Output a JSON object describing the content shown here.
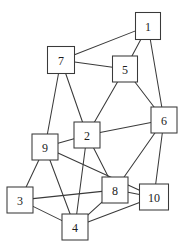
{
  "figure": {
    "background_color": "#ffffff",
    "line_color": "#3a3a3a",
    "label_color": "#1c1c1c"
  },
  "chart_data": {
    "type": "diagram",
    "subtype": "node-link-graph",
    "title": "",
    "xlabel": "",
    "ylabel": "",
    "directed": false,
    "grid": false,
    "legend": null,
    "node_count": 10,
    "edge_count": 22,
    "node_shape": "square",
    "nodes": [
      {
        "id": "1",
        "label": "1",
        "x": 148,
        "y": 26,
        "w": 25,
        "h": 27
      },
      {
        "id": "2",
        "label": "2",
        "x": 87,
        "y": 135,
        "w": 26,
        "h": 26
      },
      {
        "id": "3",
        "label": "3",
        "x": 20,
        "y": 200,
        "w": 26,
        "h": 26
      },
      {
        "id": "4",
        "label": "4",
        "x": 75,
        "y": 227,
        "w": 26,
        "h": 26
      },
      {
        "id": "5",
        "label": "5",
        "x": 125,
        "y": 69,
        "w": 25,
        "h": 26
      },
      {
        "id": "6",
        "label": "6",
        "x": 164,
        "y": 120,
        "w": 26,
        "h": 26
      },
      {
        "id": "7",
        "label": "7",
        "x": 61,
        "y": 60,
        "w": 27,
        "h": 27
      },
      {
        "id": "8",
        "label": "8",
        "x": 115,
        "y": 190,
        "w": 26,
        "h": 26
      },
      {
        "id": "9",
        "label": "9",
        "x": 45,
        "y": 147,
        "w": 26,
        "h": 26
      },
      {
        "id": "10",
        "label": "10",
        "x": 154,
        "y": 197,
        "w": 29,
        "h": 26
      }
    ],
    "edges": [
      {
        "source": "1",
        "target": "7"
      },
      {
        "source": "1",
        "target": "5"
      },
      {
        "source": "1",
        "target": "6"
      },
      {
        "source": "7",
        "target": "5"
      },
      {
        "source": "7",
        "target": "9"
      },
      {
        "source": "7",
        "target": "2"
      },
      {
        "source": "5",
        "target": "2"
      },
      {
        "source": "5",
        "target": "6"
      },
      {
        "source": "2",
        "target": "6"
      },
      {
        "source": "2",
        "target": "9"
      },
      {
        "source": "2",
        "target": "8"
      },
      {
        "source": "2",
        "target": "4"
      },
      {
        "source": "9",
        "target": "3"
      },
      {
        "source": "9",
        "target": "10"
      },
      {
        "source": "9",
        "target": "4"
      },
      {
        "source": "3",
        "target": "4"
      },
      {
        "source": "3",
        "target": "8"
      },
      {
        "source": "6",
        "target": "8"
      },
      {
        "source": "6",
        "target": "10"
      },
      {
        "source": "8",
        "target": "4"
      },
      {
        "source": "8",
        "target": "10"
      },
      {
        "source": "4",
        "target": "10"
      }
    ],
    "adjacency": {
      "1": [
        "5",
        "6",
        "7"
      ],
      "2": [
        "4",
        "5",
        "6",
        "7",
        "8",
        "9"
      ],
      "3": [
        "4",
        "8",
        "9"
      ],
      "4": [
        "2",
        "3",
        "8",
        "9",
        "10"
      ],
      "5": [
        "1",
        "2",
        "6",
        "7"
      ],
      "6": [
        "1",
        "2",
        "5",
        "8",
        "10"
      ],
      "7": [
        "1",
        "2",
        "5",
        "9"
      ],
      "8": [
        "2",
        "3",
        "4",
        "6",
        "10"
      ],
      "9": [
        "2",
        "3",
        "4",
        "7",
        "10"
      ],
      "10": [
        "4",
        "6",
        "8",
        "9"
      ]
    }
  }
}
